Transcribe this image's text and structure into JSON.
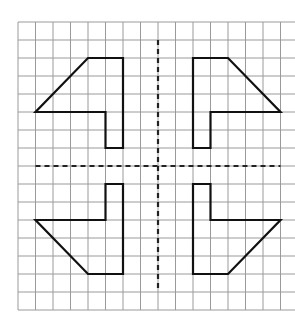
{
  "diagram": {
    "type": "grid-symmetry",
    "grid": {
      "cols": 16,
      "rows": 16,
      "origin_x": 18,
      "origin_y": 22,
      "cell_w": 17.5,
      "cell_h": 18,
      "line_color": "#9a9a9a"
    },
    "axes": {
      "vertical": {
        "col": 8,
        "from_row": 1,
        "to_row": 15
      },
      "horizontal": {
        "row": 8,
        "from_col": 1,
        "to_col": 15
      },
      "style": "dashed",
      "color": "#222222"
    },
    "shapes": [
      {
        "name": "top-left-shape",
        "points": [
          [
            4,
            2
          ],
          [
            6,
            2
          ],
          [
            6,
            7
          ],
          [
            5,
            7
          ],
          [
            5,
            5
          ],
          [
            1,
            5
          ]
        ]
      },
      {
        "name": "top-right-shape",
        "points": [
          [
            10,
            2
          ],
          [
            12,
            2
          ],
          [
            15,
            5
          ],
          [
            11,
            5
          ],
          [
            11,
            7
          ],
          [
            10,
            7
          ]
        ]
      },
      {
        "name": "bottom-left-shape",
        "points": [
          [
            5,
            9
          ],
          [
            6,
            9
          ],
          [
            6,
            14
          ],
          [
            4,
            14
          ],
          [
            1,
            11
          ],
          [
            5,
            11
          ]
        ]
      },
      {
        "name": "bottom-right-shape",
        "points": [
          [
            10,
            9
          ],
          [
            11,
            9
          ],
          [
            11,
            11
          ],
          [
            15,
            11
          ],
          [
            12,
            14
          ],
          [
            10,
            14
          ]
        ]
      }
    ],
    "shape_color": "#111111"
  }
}
